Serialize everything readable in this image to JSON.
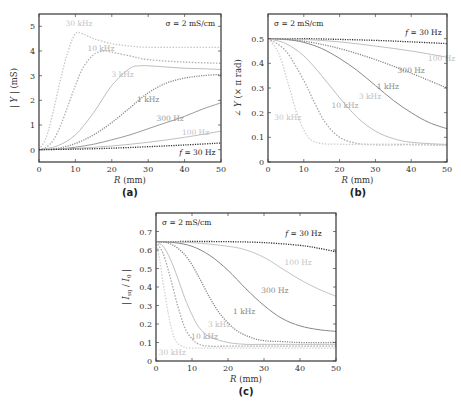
{
  "figure": {
    "captions": [
      "(a)",
      "(b)",
      "(c)"
    ]
  },
  "chart_data": [
    {
      "id": "a",
      "type": "line",
      "caption": "(a)",
      "title": "",
      "annotation": "σ = 2 mS/cm",
      "xlabel": "R (mm)",
      "ylabel": "| Y | (mS)",
      "xlim": [
        0,
        50
      ],
      "ylim": [
        -0.5,
        5.5
      ],
      "xticks": [
        0,
        10,
        20,
        30,
        40,
        50
      ],
      "yticks": [
        0,
        1,
        2,
        3,
        4,
        5
      ],
      "grid": false,
      "legend": "inline labels",
      "box": {
        "left": 39,
        "top": 14,
        "right": 221,
        "bottom": 162
      },
      "series": [
        {
          "name": "30 kHz",
          "color": "#c8c8c8",
          "dash": "1.5,1.5",
          "label_pos": [
            11,
            5.0
          ],
          "x": [
            0,
            2,
            4,
            6,
            8,
            10,
            12,
            15,
            20,
            25,
            30,
            40,
            50
          ],
          "y": [
            0,
            0.5,
            1.6,
            2.9,
            4.0,
            4.7,
            4.7,
            4.5,
            4.3,
            4.2,
            4.15,
            4.15,
            4.15
          ]
        },
        {
          "name": "10 kHz",
          "color": "#b0b0b0",
          "dash": "1.5,1.5",
          "label_pos": [
            17,
            4.0
          ],
          "x": [
            0,
            2,
            4,
            6,
            8,
            10,
            12,
            15,
            18,
            20,
            25,
            30,
            40,
            50
          ],
          "y": [
            0,
            0.1,
            0.4,
            1.0,
            1.8,
            2.6,
            3.3,
            3.85,
            4.0,
            3.95,
            3.8,
            3.65,
            3.55,
            3.5
          ]
        },
        {
          "name": "3 kHz",
          "color": "#bdbdbd",
          "dash": "",
          "label_pos": [
            23,
            2.95
          ],
          "x": [
            0,
            5,
            10,
            15,
            20,
            25,
            28,
            30,
            35,
            40,
            45,
            50
          ],
          "y": [
            0,
            0.15,
            0.6,
            1.5,
            2.6,
            3.3,
            3.4,
            3.4,
            3.35,
            3.3,
            3.28,
            3.25
          ]
        },
        {
          "name": "1 kHz",
          "color": "#888888",
          "dash": "1.2,1.2",
          "label_pos": [
            30,
            1.95
          ],
          "x": [
            0,
            5,
            10,
            15,
            20,
            25,
            30,
            35,
            40,
            45,
            50
          ],
          "y": [
            0,
            0.05,
            0.25,
            0.6,
            1.1,
            1.7,
            2.3,
            2.7,
            2.9,
            3.0,
            3.05
          ]
        },
        {
          "name": "300 Hz",
          "color": "#9a9a9a",
          "dash": "",
          "label_pos": [
            36,
            1.15
          ],
          "x": [
            0,
            5,
            10,
            15,
            20,
            25,
            30,
            35,
            40,
            45,
            50
          ],
          "y": [
            0,
            0.02,
            0.1,
            0.22,
            0.4,
            0.6,
            0.85,
            1.1,
            1.35,
            1.65,
            1.9
          ]
        },
        {
          "name": "100 Hz",
          "color": "#bfbfbf",
          "dash": "",
          "label_pos": [
            43,
            0.6
          ],
          "x": [
            0,
            10,
            20,
            30,
            40,
            50
          ],
          "y": [
            0,
            0.05,
            0.15,
            0.3,
            0.5,
            0.75
          ]
        },
        {
          "name": "f = 30 Hz",
          "color": "#333333",
          "dash": "1.2,1.2",
          "label_pos": [
            48.5,
            -0.2
          ],
          "x": [
            0,
            10,
            20,
            30,
            40,
            50
          ],
          "y": [
            0,
            0.02,
            0.06,
            0.12,
            0.19,
            0.27
          ]
        }
      ]
    },
    {
      "id": "b",
      "type": "line",
      "caption": "(b)",
      "title": "",
      "annotation": "σ = 2 mS/cm",
      "xlabel": "R (mm)",
      "ylabel": "∠ Y (× π rad)",
      "xlim": [
        0,
        50
      ],
      "ylim": [
        0,
        0.6
      ],
      "xticks": [
        0,
        10,
        20,
        30,
        40,
        50
      ],
      "yticks": [
        0,
        0.1,
        0.2,
        0.3,
        0.4,
        0.5
      ],
      "grid": false,
      "legend": "inline labels",
      "box": {
        "left": 268,
        "top": 14,
        "right": 447,
        "bottom": 162
      },
      "series": [
        {
          "name": "f = 30 Hz",
          "color": "#333333",
          "dash": "1.2,1.2",
          "label_pos": [
            48.5,
            0.515
          ],
          "x": [
            0,
            10,
            20,
            30,
            40,
            50
          ],
          "y": [
            0.5,
            0.5,
            0.497,
            0.493,
            0.487,
            0.48
          ]
        },
        {
          "name": "100 Hz",
          "color": "#bfbfbf",
          "dash": "",
          "label_pos": [
            48.5,
            0.41
          ],
          "x": [
            0,
            10,
            20,
            30,
            40,
            50
          ],
          "y": [
            0.5,
            0.497,
            0.487,
            0.47,
            0.45,
            0.425
          ]
        },
        {
          "name": "300 Hz",
          "color": "#888888",
          "dash": "1.2,1.2",
          "label_pos": [
            40,
            0.36
          ],
          "x": [
            0,
            10,
            20,
            30,
            40,
            50
          ],
          "y": [
            0.5,
            0.49,
            0.46,
            0.415,
            0.36,
            0.3
          ]
        },
        {
          "name": "1 kHz",
          "color": "#888888",
          "dash": "",
          "label_pos": [
            33.5,
            0.295
          ],
          "x": [
            0,
            5,
            10,
            15,
            20,
            25,
            30,
            35,
            40,
            45,
            50
          ],
          "y": [
            0.5,
            0.497,
            0.485,
            0.46,
            0.42,
            0.37,
            0.31,
            0.25,
            0.2,
            0.16,
            0.135
          ]
        },
        {
          "name": "3 kHz",
          "color": "#bdbdbd",
          "dash": "",
          "label_pos": [
            28.5,
            0.255
          ],
          "x": [
            0,
            5,
            10,
            15,
            20,
            25,
            30,
            35,
            40,
            50
          ],
          "y": [
            0.5,
            0.48,
            0.43,
            0.35,
            0.26,
            0.18,
            0.125,
            0.095,
            0.08,
            0.07
          ]
        },
        {
          "name": "10 kHz",
          "color": "#a8a8a8",
          "dash": "1.5,1.5",
          "label_pos": [
            21.5,
            0.22
          ],
          "x": [
            0,
            5,
            10,
            13,
            16,
            20,
            25,
            30,
            40,
            50
          ],
          "y": [
            0.5,
            0.45,
            0.33,
            0.24,
            0.16,
            0.1,
            0.075,
            0.07,
            0.07,
            0.068
          ]
        },
        {
          "name": "30 kHz",
          "color": "#cfcfcf",
          "dash": "1.5,1.5",
          "label_pos": [
            5.5,
            0.17
          ],
          "x": [
            0,
            3,
            6,
            8,
            10,
            12,
            15,
            20,
            30,
            50
          ],
          "y": [
            0.5,
            0.44,
            0.3,
            0.2,
            0.13,
            0.09,
            0.075,
            0.072,
            0.072,
            0.072
          ]
        }
      ]
    },
    {
      "id": "c",
      "type": "line",
      "caption": "(c)",
      "title": "",
      "annotation": "σ = 2 mS/cm",
      "xlabel": "R (mm)",
      "ylabel": "| I_sq / I_0 |",
      "xlim": [
        0,
        50
      ],
      "ylim": [
        0,
        0.8
      ],
      "xticks": [
        0,
        10,
        20,
        30,
        40,
        50
      ],
      "yticks": [
        0,
        0.1,
        0.2,
        0.3,
        0.4,
        0.5,
        0.6,
        0.7
      ],
      "grid": false,
      "legend": "inline labels",
      "box": {
        "left": 156,
        "top": 213,
        "right": 336,
        "bottom": 361
      },
      "series": [
        {
          "name": "f = 30 Hz",
          "color": "#333333",
          "dash": "1.2,1.2",
          "label_pos": [
            46,
            0.675
          ],
          "x": [
            0,
            10,
            20,
            30,
            40,
            45,
            50
          ],
          "y": [
            0.645,
            0.646,
            0.645,
            0.64,
            0.625,
            0.61,
            0.59
          ]
        },
        {
          "name": "100 Hz",
          "color": "#c4c4c4",
          "dash": "",
          "label_pos": [
            39.5,
            0.52
          ],
          "x": [
            0,
            10,
            20,
            25,
            30,
            35,
            40,
            45,
            50
          ],
          "y": [
            0.645,
            0.64,
            0.62,
            0.6,
            0.56,
            0.5,
            0.44,
            0.39,
            0.35
          ]
        },
        {
          "name": "300 Hz",
          "color": "#888888",
          "dash": "",
          "label_pos": [
            33,
            0.37
          ],
          "x": [
            0,
            5,
            10,
            15,
            20,
            25,
            30,
            35,
            40,
            45,
            50
          ],
          "y": [
            0.645,
            0.64,
            0.62,
            0.57,
            0.49,
            0.39,
            0.3,
            0.23,
            0.19,
            0.17,
            0.16
          ]
        },
        {
          "name": "1 kHz",
          "color": "#888888",
          "dash": "1.2,1.2",
          "label_pos": [
            24.5,
            0.255
          ],
          "x": [
            0,
            3,
            6,
            9,
            12,
            15,
            18,
            22,
            26,
            30,
            35,
            40,
            50
          ],
          "y": [
            0.645,
            0.64,
            0.61,
            0.55,
            0.45,
            0.34,
            0.25,
            0.17,
            0.13,
            0.11,
            0.105,
            0.1,
            0.1
          ]
        },
        {
          "name": "3 kHz",
          "color": "#c0c0c0",
          "dash": "",
          "label_pos": [
            17.5,
            0.185
          ],
          "x": [
            0,
            2,
            4,
            6,
            8,
            10,
            12,
            15,
            20,
            25,
            30,
            40,
            50
          ],
          "y": [
            0.645,
            0.62,
            0.55,
            0.45,
            0.34,
            0.25,
            0.18,
            0.13,
            0.1,
            0.09,
            0.09,
            0.09,
            0.09
          ]
        },
        {
          "name": "10 kHz",
          "color": "#a8a8a8",
          "dash": "1.5,1.5",
          "label_pos": [
            13.5,
            0.12
          ],
          "x": [
            0,
            2,
            4,
            6,
            8,
            10,
            12,
            15,
            20,
            30,
            50
          ],
          "y": [
            0.645,
            0.58,
            0.45,
            0.3,
            0.18,
            0.12,
            0.09,
            0.08,
            0.08,
            0.08,
            0.08
          ]
        },
        {
          "name": "30 kHz",
          "color": "#d2d2d2",
          "dash": "1.5,1.5",
          "label_pos": [
            4.5,
            0.03
          ],
          "x": [
            0,
            1,
            2,
            3,
            4,
            5,
            6,
            8,
            10,
            20,
            50
          ],
          "y": [
            0.645,
            0.55,
            0.42,
            0.3,
            0.2,
            0.13,
            0.095,
            0.075,
            0.07,
            0.07,
            0.07
          ]
        }
      ]
    }
  ]
}
